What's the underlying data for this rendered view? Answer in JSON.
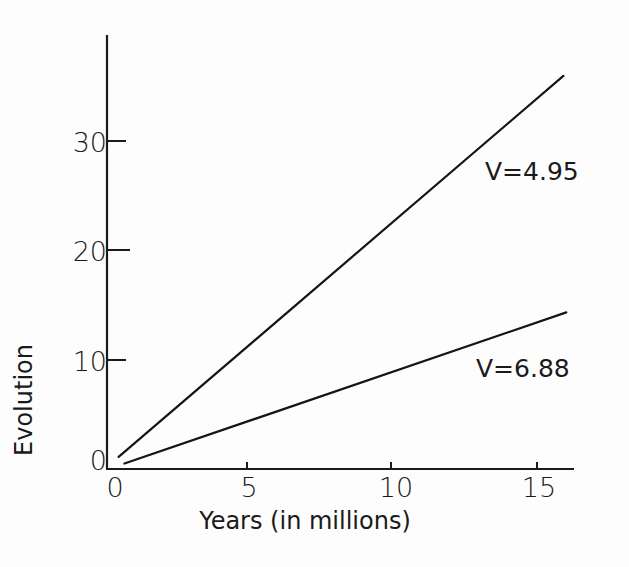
{
  "chart_data": {
    "type": "line",
    "title": "",
    "xlabel": "Years (in millions)",
    "ylabel": "Evolution",
    "xlim": [
      0,
      16
    ],
    "ylim": [
      0,
      39
    ],
    "x_ticks": [
      0,
      5,
      10,
      15
    ],
    "x_tick_labels": [
      "0",
      "5",
      "10",
      "15"
    ],
    "y_ticks": [
      0,
      10,
      20,
      30
    ],
    "y_tick_labels": [
      "0",
      "10",
      "20",
      "30"
    ],
    "grid": false,
    "legend": "none; series labeled inline at line ends",
    "series": [
      {
        "name": "V=4.95",
        "x": [
          0.4,
          15.7
        ],
        "y": [
          1.1,
          35.9
        ]
      },
      {
        "name": "V=6.88",
        "x": [
          0.6,
          15.8
        ],
        "y": [
          0.5,
          14.3
        ]
      }
    ],
    "annotations": [
      {
        "text": "V=4.95",
        "near_series": 0
      },
      {
        "text": "V=6.88",
        "near_series": 1
      }
    ]
  },
  "axes": {
    "x_label": "Years (in millions)",
    "y_label": "Evolution",
    "x_tick_labels": [
      "0",
      "5",
      "10",
      "15"
    ],
    "y_tick_labels": [
      "0",
      "10",
      "20",
      "30"
    ]
  },
  "labels": {
    "upper": "V=4.95",
    "lower": "V=6.88"
  }
}
